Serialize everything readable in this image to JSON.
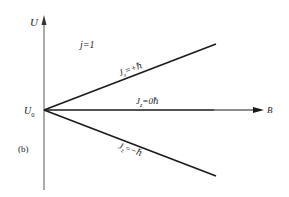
{
  "diagram": {
    "panel_label": "(b)",
    "axes": {
      "y_label": "U",
      "x_label": "B",
      "origin_label": "U",
      "origin_subscript": "0"
    },
    "quantum_number": "j=1",
    "levels": [
      {
        "prefix": "J",
        "subscript": "z",
        "value": "=+ℏ",
        "direction": "up"
      },
      {
        "prefix": "J",
        "subscript": "z",
        "value": "=0ℏ",
        "direction": "flat"
      },
      {
        "prefix": "J",
        "subscript": "z",
        "value": "=−ℏ",
        "direction": "down"
      }
    ],
    "colors": {
      "line": "#1a1a1a",
      "axis": "#555555",
      "text": "#222222"
    }
  }
}
